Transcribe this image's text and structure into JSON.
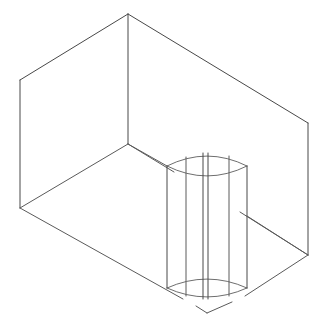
{
  "scene": {
    "title": "Wireframe line drawing of an open rectangular box containing a vertical cylinder",
    "canvas": {
      "width": 329,
      "height": 328
    },
    "background_color": "#ffffff",
    "line_color": "#5a5a5a",
    "line_width": 1,
    "objects": [
      {
        "name": "open-box",
        "type": "rectangular-enclosure",
        "shading": "wireframe"
      },
      {
        "name": "cylinder",
        "type": "vertical-cylinder",
        "shading": "wireframe",
        "silhouette_lines": 6
      }
    ],
    "box_vertices": {
      "top_back_apex": [
        128,
        14
      ],
      "top_left": [
        20,
        80
      ],
      "top_right": [
        308,
        123
      ],
      "top_front_center": [
        207,
        190
      ],
      "floor_back_center": [
        128,
        144
      ],
      "floor_left": [
        20,
        208
      ],
      "floor_right": [
        308,
        255
      ],
      "floor_front_center": [
        207,
        313
      ]
    },
    "box_edges": [
      {
        "name": "top-rim-back-left",
        "from": [
          20,
          80
        ],
        "to": [
          128,
          14
        ]
      },
      {
        "name": "top-rim-back-right",
        "from": [
          128,
          14
        ],
        "to": [
          308,
          123
        ]
      },
      {
        "name": "vertical-back-corner",
        "from": [
          128,
          14
        ],
        "to": [
          128,
          144
        ]
      },
      {
        "name": "vertical-left-corner",
        "from": [
          20,
          80
        ],
        "to": [
          20,
          208
        ]
      },
      {
        "name": "vertical-right-corner",
        "from": [
          308,
          123
        ],
        "to": [
          308,
          255
        ]
      },
      {
        "name": "floor-back-left",
        "from": [
          20,
          208
        ],
        "to": [
          128,
          144
        ]
      },
      {
        "name": "floor-back-right",
        "from": [
          128,
          144
        ],
        "to": [
          308,
          255
        ]
      },
      {
        "name": "floor-front-left",
        "from": [
          20,
          208
        ],
        "to": [
          207,
          313
        ]
      },
      {
        "name": "floor-front-right",
        "from": [
          207,
          313
        ],
        "to": [
          308,
          255
        ]
      },
      {
        "name": "diagonal-left-wall-crease",
        "from": [
          128,
          144
        ],
        "to": [
          167,
          166
        ]
      },
      {
        "name": "diagonal-right-wall-crease",
        "from": [
          128,
          144
        ],
        "to": [
          308,
          255
        ]
      }
    ],
    "cylinder": {
      "name": "cylinder",
      "left_x": 167,
      "right_x": 247,
      "top_y": 155,
      "bottom_y": 288,
      "top_ellipse_ry": 10,
      "bottom_ellipse_ry": 9,
      "center_x": 207,
      "generatrix_x": [
        167,
        186,
        203,
        208,
        229,
        247
      ]
    }
  }
}
